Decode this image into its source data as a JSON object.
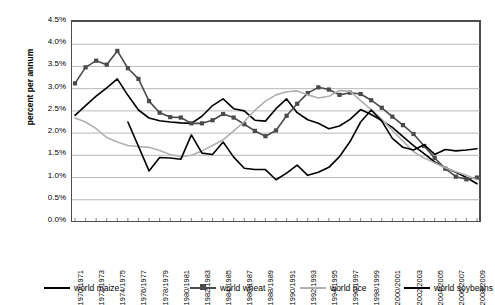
{
  "chart_data": {
    "type": "line",
    "title": "",
    "xlabel": "",
    "ylabel": "percent per annum",
    "ylim": [
      0,
      4.5
    ],
    "ytick_step": 0.5,
    "ytick_labels": [
      "4.5%",
      "4.0%",
      "3.5%",
      "3.0%",
      "2.5%",
      "2.0%",
      "1.5%",
      "1.0%",
      "0.5%",
      "0.0%"
    ],
    "ytick_values": [
      4.5,
      4.0,
      3.5,
      3.0,
      2.5,
      2.0,
      1.5,
      1.0,
      0.5,
      0.0
    ],
    "grid": "horizontal",
    "legend_position": "bottom",
    "x": [
      "1970/1971",
      "1971/1972",
      "1972/1973",
      "1973/1974",
      "1974/1975",
      "1975/1976",
      "1976/1977",
      "1977/1978",
      "1978/1979",
      "1979/1980",
      "1980/1981",
      "1981/1982",
      "1982/1983",
      "1983/1984",
      "1984/1985",
      "1985/1986",
      "1986/1987",
      "1987/1988",
      "1988/1989",
      "1989/1990",
      "1990/1991",
      "1991/1992",
      "1992/1993",
      "1993/1994",
      "1994/1995",
      "1995/1996",
      "1996/1997",
      "1997/1998",
      "1998/1999",
      "1999/2000",
      "2000/2001",
      "2001/2002",
      "2002/2003",
      "2003/2004",
      "2004/2005",
      "2005/2006",
      "2006/2007",
      "2007/2008",
      "2008/2009"
    ],
    "xtick_labels": [
      "1970/1971",
      "1972/1973",
      "1974/1975",
      "1976/1977",
      "1978/1979",
      "1980/1981",
      "1982/1983",
      "1984/1985",
      "1986/1987",
      "1988/1989",
      "1990/1991",
      "1992/1993",
      "1994/1995",
      "1996/1997",
      "1998/1999",
      "2000/2001",
      "2002/2003",
      "2004/2005",
      "2006/2007",
      "2008/2009"
    ],
    "xtick_indices": [
      0,
      2,
      4,
      6,
      8,
      10,
      12,
      14,
      16,
      18,
      20,
      22,
      24,
      26,
      28,
      30,
      32,
      34,
      36,
      38
    ],
    "series": [
      {
        "name": "world maize",
        "color": "#000000",
        "width": 1.6,
        "marker": "none",
        "values": [
          2.4,
          2.62,
          2.83,
          3.02,
          3.22,
          2.85,
          2.52,
          2.34,
          2.28,
          2.25,
          2.23,
          2.22,
          2.38,
          2.62,
          2.77,
          2.55,
          2.5,
          2.29,
          2.27,
          2.55,
          2.77,
          2.46,
          2.3,
          2.22,
          2.1,
          2.16,
          2.31,
          2.53,
          2.42,
          2.28,
          2.13,
          1.92,
          1.72,
          1.54,
          1.35,
          1.22,
          1.12,
          1.0,
          0.86
        ]
      },
      {
        "name": "world wheat",
        "color": "#4a4a4a",
        "width": 1.6,
        "marker": "square",
        "values": [
          3.12,
          3.48,
          3.63,
          3.54,
          3.85,
          3.46,
          3.22,
          2.72,
          2.46,
          2.36,
          2.35,
          2.22,
          2.22,
          2.29,
          2.43,
          2.35,
          2.2,
          2.05,
          1.93,
          2.06,
          2.39,
          2.66,
          2.9,
          3.03,
          2.98,
          2.86,
          2.91,
          2.88,
          2.74,
          2.57,
          2.37,
          2.18,
          1.98,
          1.71,
          1.44,
          1.2,
          1.02,
          0.96,
          1.0
        ]
      },
      {
        "name": "world rice",
        "color": "#b0b0b0",
        "width": 1.6,
        "marker": "none",
        "values": [
          2.34,
          2.25,
          2.1,
          1.9,
          1.8,
          1.72,
          1.7,
          1.68,
          1.61,
          1.52,
          1.47,
          1.5,
          1.6,
          1.72,
          1.85,
          2.05,
          2.26,
          2.51,
          2.72,
          2.86,
          2.93,
          2.95,
          2.86,
          2.79,
          2.83,
          2.96,
          2.94,
          2.73,
          2.53,
          2.31,
          2.06,
          1.82,
          1.58,
          1.44,
          1.33,
          1.22,
          1.13,
          1.05,
          0.95
        ]
      },
      {
        "name": "world soybeans",
        "color": "#000000",
        "width": 1.6,
        "marker": "none",
        "start_index": 5,
        "values": [
          null,
          null,
          null,
          null,
          null,
          2.25,
          1.7,
          1.15,
          1.45,
          1.44,
          1.41,
          1.96,
          1.55,
          1.52,
          1.8,
          1.46,
          1.21,
          1.18,
          1.18,
          0.95,
          1.1,
          1.28,
          1.05,
          1.12,
          1.23,
          1.47,
          1.81,
          2.25,
          2.52,
          2.27,
          1.88,
          1.68,
          1.62,
          1.74,
          1.52,
          1.63,
          1.6,
          1.62,
          1.65
        ]
      }
    ]
  },
  "legend": {
    "items": [
      {
        "label": "world maize",
        "color": "#000000",
        "marker": "none"
      },
      {
        "label": "world wheat",
        "color": "#4a4a4a",
        "marker": "square"
      },
      {
        "label": "world rice",
        "color": "#b0b0b0",
        "marker": "none"
      },
      {
        "label": "world soybeans",
        "color": "#000000",
        "marker": "none"
      }
    ]
  },
  "axes": {
    "y_title": "percent per annum"
  },
  "colors": {
    "grid": "#a6a6a6",
    "axis": "#4d4d4d",
    "background": "#ffffff"
  }
}
